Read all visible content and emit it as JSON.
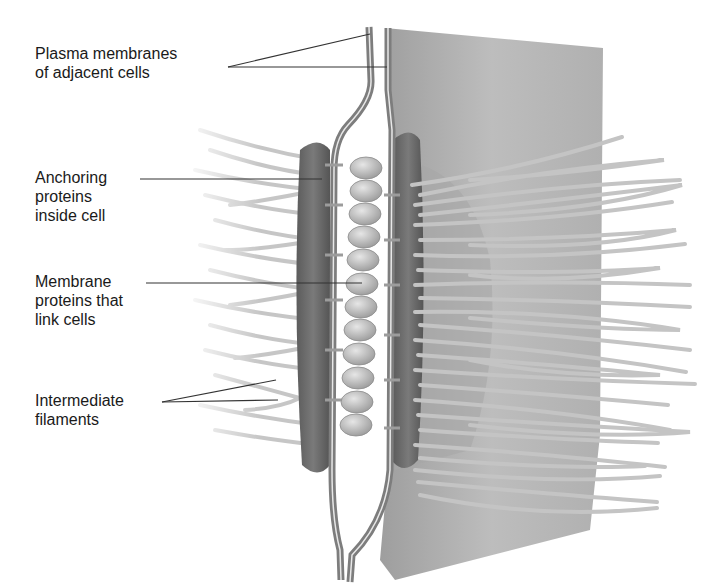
{
  "diagram": {
    "labels": [
      {
        "id": "plasma-membranes",
        "text": "Plasma membranes\nof adjacent cells",
        "x": 35,
        "y": 44
      },
      {
        "id": "anchoring-proteins",
        "text": "Anchoring\nproteins\ninside cell",
        "x": 35,
        "y": 168
      },
      {
        "id": "membrane-proteins",
        "text": "Membrane\nproteins that\nlink cells",
        "x": 35,
        "y": 272
      },
      {
        "id": "intermediate-filaments",
        "text": "Intermediate\nfilaments",
        "x": 35,
        "y": 395
      }
    ],
    "colors": {
      "label_text": "#1a1a1a",
      "leader_line": "#333333",
      "sheet": "#b5b5b5",
      "plaque": "#6e6e6e",
      "membrane": "#8c8c8c",
      "oval": "#c8c8c8",
      "filament": "#c9c9c9"
    }
  }
}
